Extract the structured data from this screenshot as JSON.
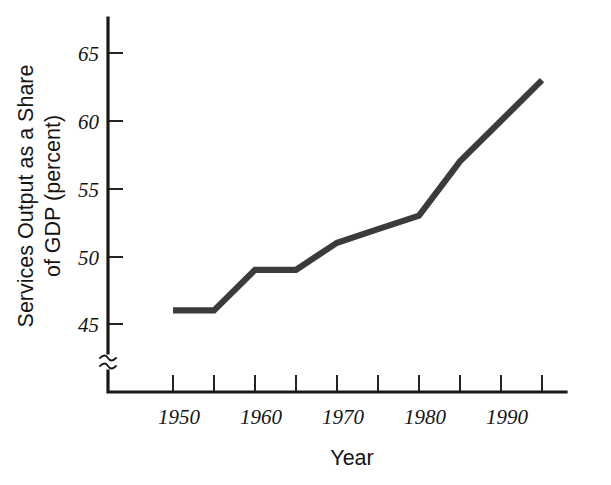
{
  "chart_data": {
    "type": "line",
    "title": "",
    "xlabel": "Year",
    "ylabel": "Services Output as a Share of GDP (percent)",
    "ylabel_line1": "Services Output as a Share",
    "ylabel_line2": "of GDP (percent)",
    "x": [
      1950,
      1955,
      1960,
      1965,
      1970,
      1975,
      1980,
      1985,
      1990,
      1995
    ],
    "values": [
      46,
      46,
      49,
      49,
      51,
      52,
      53,
      57,
      60,
      63
    ],
    "series": [
      {
        "name": "Services Output as a Share of GDP",
        "values": [
          46,
          46,
          49,
          49,
          51,
          52,
          53,
          57,
          60,
          63
        ]
      }
    ],
    "xlim": [
      1947.5,
      1997.5
    ],
    "ylim": [
      44.2,
      66.5
    ],
    "xticks": [
      1950,
      1955,
      1960,
      1965,
      1970,
      1975,
      1980,
      1985,
      1990,
      1995
    ],
    "xtick_labels": [
      "1950",
      "",
      "1960",
      "",
      "1970",
      "",
      "1980",
      "",
      "1990",
      ""
    ],
    "yticks": [
      45,
      50,
      55,
      60,
      65
    ],
    "ytick_labels": [
      "45",
      "50",
      "55",
      "60",
      "65"
    ],
    "grid": false,
    "legend": false,
    "axis_break_y": true,
    "line_color": "#3b3b3b",
    "axis_color": "#181818"
  },
  "axis": {
    "y_labels": [
      "65",
      "60",
      "55",
      "50",
      "45"
    ],
    "x_labels": [
      "1950",
      "1960",
      "1970",
      "1980",
      "1990"
    ],
    "x_title": "Year",
    "y_title_line1": "Services Output as a Share",
    "y_title_line2": "of GDP (percent)"
  }
}
